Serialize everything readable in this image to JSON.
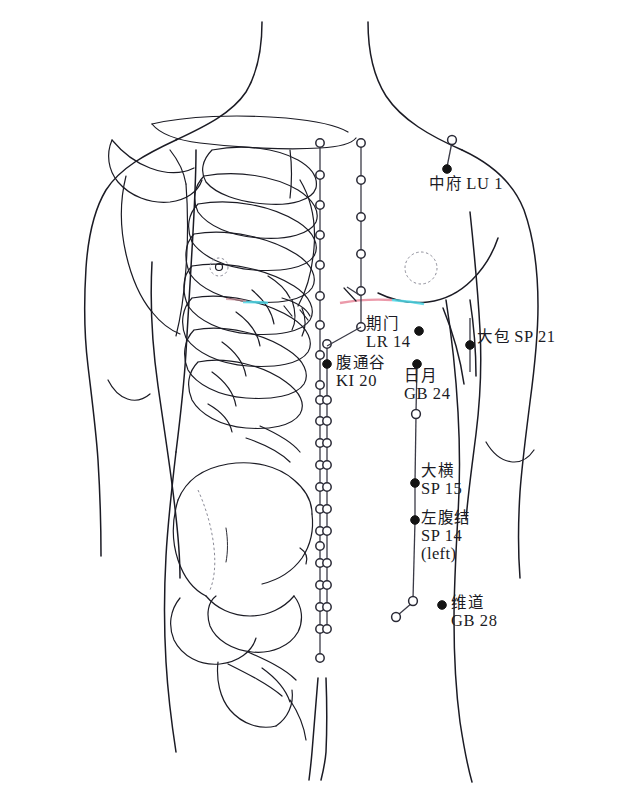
{
  "figure": {
    "view": "anterior torso with skeletal overlay",
    "background_color": "#ffffff",
    "line_color": "#1b1b24",
    "point_fill_solid": "#141414",
    "point_fill_open": "#ffffff",
    "accent_cyan": "#4fd8e8",
    "accent_pink": "#e8889b"
  },
  "points": [
    {
      "id": "lu1",
      "cn": "中府",
      "code": "LU 1",
      "marker": "solid",
      "marker_x": 447,
      "marker_y": 169,
      "label_x": 429,
      "label_y": 175,
      "layout": "inline"
    },
    {
      "id": "lr14",
      "cn": "期门",
      "code": "LR 14",
      "marker": "solid",
      "marker_x": 419,
      "marker_y": 331,
      "label_x": 366,
      "label_y": 316,
      "layout": "stack"
    },
    {
      "id": "ki20",
      "cn": "腹通谷",
      "code": "KI 20",
      "marker": "solid",
      "marker_x": 327,
      "marker_y": 364,
      "label_x": 336,
      "label_y": 355,
      "layout": "stack"
    },
    {
      "id": "sp21",
      "cn": "大包",
      "code": "SP 21",
      "marker": "solid",
      "marker_x": 470,
      "marker_y": 345,
      "label_x": 477,
      "label_y": 328,
      "layout": "inline"
    },
    {
      "id": "gb24",
      "cn": "日月",
      "code": "GB 24",
      "marker": "solid",
      "marker_x": 417,
      "marker_y": 364,
      "label_x": 404,
      "label_y": 368,
      "layout": "stack"
    },
    {
      "id": "sp15",
      "cn": "大横",
      "code": "SP 15",
      "marker": "solid",
      "marker_x": 415,
      "marker_y": 483,
      "label_x": 421,
      "label_y": 463,
      "layout": "stack"
    },
    {
      "id": "sp14",
      "cn": "左腹结",
      "code": "SP 14",
      "side_note": "(left)",
      "marker": "solid",
      "marker_x": 415,
      "marker_y": 520,
      "label_x": 421,
      "label_y": 510,
      "layout": "stack"
    },
    {
      "id": "gb28",
      "cn": "维道",
      "code": "GB 28",
      "marker": "solid",
      "marker_x": 442,
      "marker_y": 605,
      "label_x": 451,
      "label_y": 595,
      "layout": "stack"
    }
  ],
  "meridian_chains": [
    {
      "name": "kidney-line-left",
      "x": 320,
      "circle_ys": [
        143,
        175,
        205,
        235,
        265,
        296,
        325,
        355,
        385,
        400,
        421,
        443,
        465,
        487,
        509,
        531,
        546,
        563,
        585,
        607,
        629,
        658
      ]
    },
    {
      "name": "kidney-line-right",
      "x": 361,
      "circle_ys": [
        143,
        180,
        217,
        254,
        291,
        327
      ]
    },
    {
      "name": "stomach-line-inner",
      "x": 327,
      "circle_ys": [
        344,
        400,
        421,
        443,
        465,
        487,
        509,
        531,
        563,
        585,
        607,
        629
      ]
    }
  ],
  "open_markers": [
    {
      "name": "lu1-upper-node",
      "x": 452,
      "y": 140
    },
    {
      "name": "gb24-lower-node",
      "x": 416,
      "y": 414
    },
    {
      "name": "gb28-node-upper",
      "x": 413,
      "y": 601
    },
    {
      "name": "gb28-node-lower",
      "x": 396,
      "y": 617
    }
  ]
}
